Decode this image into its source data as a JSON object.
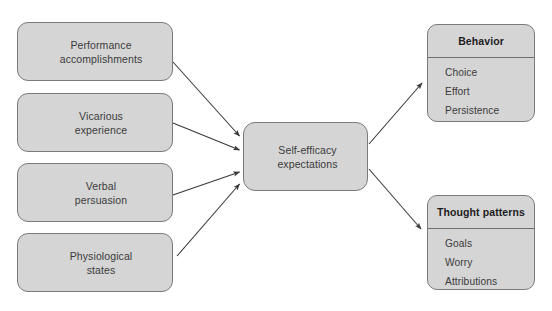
{
  "diagram": {
    "colors": {
      "node_fill": "#d5d5d5",
      "node_border": "#7b7b7b",
      "text": "#3b3b3b",
      "heading_text": "#1d1d1d",
      "arrow": "#3a3a3a",
      "background": "#ffffff"
    },
    "sources": [
      {
        "id": "performance",
        "label": "Performance\naccomplishments"
      },
      {
        "id": "vicarious",
        "label": "Vicarious\nexperience"
      },
      {
        "id": "verbal",
        "label": "Verbal\npersuasion"
      },
      {
        "id": "physiological",
        "label": "Physiological\nstates"
      }
    ],
    "center": {
      "id": "self-efficacy",
      "label": "Self-efficacy\nexpectations"
    },
    "outcomes": [
      {
        "id": "behavior",
        "title": "Behavior",
        "items": [
          "Choice",
          "Effort",
          "Persistence"
        ]
      },
      {
        "id": "thought-patterns",
        "title": "Thought patterns",
        "items": [
          "Goals",
          "Worry",
          "Attributions"
        ]
      }
    ],
    "arrows": [
      {
        "name": "performance-to-self-efficacy",
        "from": "performance",
        "to": "self-efficacy"
      },
      {
        "name": "vicarious-to-self-efficacy",
        "from": "vicarious",
        "to": "self-efficacy"
      },
      {
        "name": "verbal-to-self-efficacy",
        "from": "verbal",
        "to": "self-efficacy"
      },
      {
        "name": "physiological-to-self-efficacy",
        "from": "physiological",
        "to": "self-efficacy"
      },
      {
        "name": "self-efficacy-to-behavior",
        "from": "self-efficacy",
        "to": "behavior"
      },
      {
        "name": "self-efficacy-to-thought-patterns",
        "from": "self-efficacy",
        "to": "thought-patterns"
      }
    ]
  }
}
